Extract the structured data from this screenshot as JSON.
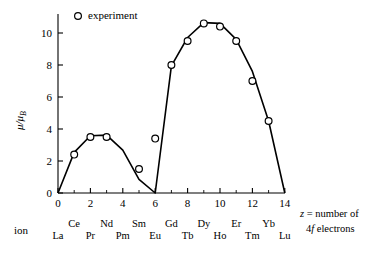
{
  "chart_data": {
    "type": "line",
    "title": "",
    "subtitle": "",
    "xlabel": "z = number of 4f electrons",
    "ylabel": "μ/μ_B",
    "xlim": [
      0,
      14
    ],
    "ylim": [
      0,
      11.5
    ],
    "grid": false,
    "legend_position": "top-left-inside",
    "x_ticks": [
      0,
      2,
      4,
      6,
      8,
      10,
      12,
      14
    ],
    "x_tick_labels": [
      "0",
      "2",
      "4",
      "6",
      "8",
      "10",
      "12",
      "14"
    ],
    "y_ticks": [
      0,
      2,
      4,
      6,
      8,
      10
    ],
    "y_tick_labels": [
      "0",
      "2",
      "4",
      "6",
      "8",
      "10"
    ],
    "x_minor_ticks": [
      1,
      3,
      5,
      7,
      9,
      11,
      13
    ],
    "ion_axis_name": "ion",
    "ion_labels_upper": [
      {
        "z": 1,
        "label": "Ce"
      },
      {
        "z": 3,
        "label": "Nd"
      },
      {
        "z": 5,
        "label": "Sm"
      },
      {
        "z": 7,
        "label": "Gd"
      },
      {
        "z": 9,
        "label": "Dy"
      },
      {
        "z": 11,
        "label": "Er"
      },
      {
        "z": 13,
        "label": "Yb"
      }
    ],
    "ion_labels_lower": [
      {
        "z": 0,
        "label": "La"
      },
      {
        "z": 2,
        "label": "Pr"
      },
      {
        "z": 4,
        "label": "Pm"
      },
      {
        "z": 6,
        "label": "Eu"
      },
      {
        "z": 8,
        "label": "Tb"
      },
      {
        "z": 10,
        "label": "Ho"
      },
      {
        "z": 12,
        "label": "Tm"
      },
      {
        "z": 14,
        "label": "Lu"
      }
    ],
    "series": [
      {
        "name": "theory",
        "style": "line",
        "x": [
          0,
          1,
          2,
          3,
          4,
          5,
          6,
          6,
          7,
          8,
          9,
          10,
          11,
          12,
          13,
          14
        ],
        "values": [
          0,
          2.54,
          3.58,
          3.62,
          2.68,
          0.85,
          0,
          0,
          7.94,
          9.72,
          10.65,
          10.6,
          9.6,
          7.6,
          4.5,
          0
        ]
      },
      {
        "name": "experiment",
        "style": "open-circle-markers",
        "x": [
          1,
          2,
          3,
          5,
          6,
          7,
          8,
          9,
          10,
          11,
          12,
          13
        ],
        "values": [
          2.4,
          3.5,
          3.5,
          1.5,
          3.4,
          8.0,
          9.5,
          10.6,
          10.4,
          9.5,
          7.0,
          4.5
        ]
      }
    ],
    "legend": [
      {
        "label": "experiment",
        "marker": "open-circle"
      }
    ],
    "axis_note_line1": "z = number of",
    "axis_note_line2": "4f electrons"
  },
  "colors": {
    "curve": "#000000",
    "axis": "#000000",
    "marker_stroke": "#000000",
    "marker_fill": "#ffffff",
    "background": "#ffffff"
  }
}
